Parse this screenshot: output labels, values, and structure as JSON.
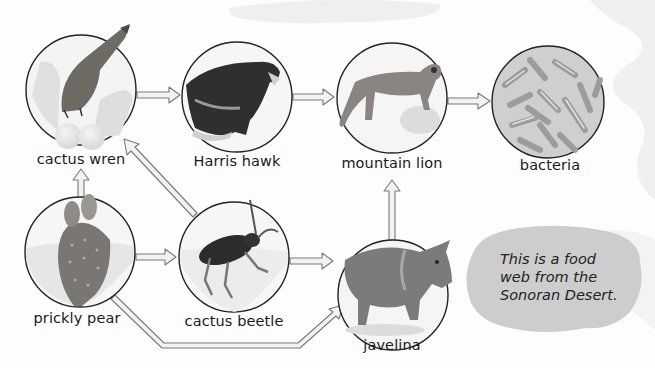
{
  "diagram": {
    "type": "food-web",
    "caption": [
      "This is a food",
      "web from the",
      "Sonoran Desert."
    ],
    "nodes": [
      {
        "id": "cactus_wren",
        "label": "cactus wren",
        "icon": "bird-icon"
      },
      {
        "id": "harris_hawk",
        "label": "Harris hawk",
        "icon": "hawk-icon"
      },
      {
        "id": "mountain_lion",
        "label": "mountain lion",
        "icon": "mountain-lion-icon"
      },
      {
        "id": "bacteria",
        "label": "bacteria",
        "icon": "bacteria-icon"
      },
      {
        "id": "prickly_pear",
        "label": "prickly pear",
        "icon": "cactus-icon"
      },
      {
        "id": "cactus_beetle",
        "label": "cactus beetle",
        "icon": "beetle-icon"
      },
      {
        "id": "javelina",
        "label": "javelina",
        "icon": "javelina-icon"
      }
    ],
    "edges": [
      {
        "from": "cactus_wren",
        "to": "harris_hawk"
      },
      {
        "from": "harris_hawk",
        "to": "mountain_lion"
      },
      {
        "from": "mountain_lion",
        "to": "bacteria"
      },
      {
        "from": "prickly_pear",
        "to": "cactus_wren"
      },
      {
        "from": "prickly_pear",
        "to": "cactus_beetle"
      },
      {
        "from": "prickly_pear",
        "to": "javelina"
      },
      {
        "from": "cactus_beetle",
        "to": "cactus_wren"
      },
      {
        "from": "cactus_beetle",
        "to": "javelina"
      },
      {
        "from": "javelina",
        "to": "mountain_lion"
      }
    ]
  }
}
